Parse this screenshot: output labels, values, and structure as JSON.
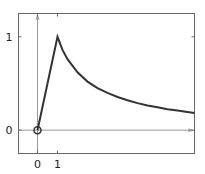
{
  "chart_data": {
    "type": "line",
    "title": "",
    "xlabel": "",
    "ylabel": "",
    "xlim": [
      -0.95,
      7.85
    ],
    "ylim": [
      -0.25,
      1.25
    ],
    "grid": false,
    "x_ticks": [
      {
        "value": 0,
        "label": "0"
      },
      {
        "value": 1,
        "label": "1"
      }
    ],
    "y_ticks": [
      {
        "value": 0,
        "label": "0"
      },
      {
        "value": 1,
        "label": "1"
      }
    ],
    "series": [
      {
        "name": "signal",
        "x": [
          0,
          1,
          1.25,
          1.5,
          2,
          2.5,
          3,
          3.5,
          4,
          4.5,
          5,
          5.5,
          6,
          6.5,
          7,
          7.5,
          7.85
        ],
        "y": [
          0,
          1,
          0.86,
          0.76,
          0.62,
          0.52,
          0.45,
          0.4,
          0.355,
          0.32,
          0.29,
          0.265,
          0.245,
          0.225,
          0.21,
          0.195,
          0.185
        ]
      }
    ],
    "annotations": [
      {
        "type": "circle-marker",
        "x": 0,
        "y": 0
      }
    ]
  }
}
